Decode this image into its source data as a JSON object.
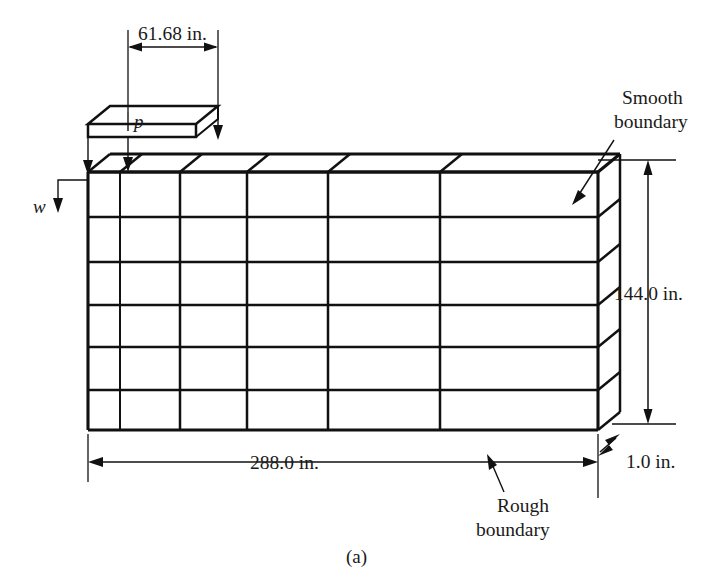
{
  "figure": {
    "caption": "(a)",
    "dimensions": {
      "top_patch_width": "61.68 in.",
      "overall_width": "288.0 in.",
      "overall_height": "144.0 in.",
      "thickness": "1.0 in."
    },
    "labels": {
      "pressure": "p",
      "deflection": "w"
    },
    "annotations": {
      "smooth_boundary_line1": "Smooth",
      "smooth_boundary_line2": "boundary",
      "rough_boundary_line1": "Rough",
      "rough_boundary_line2": "boundary"
    },
    "colors": {
      "ink": "#111111",
      "background": "#ffffff"
    }
  },
  "mesh": {
    "columns": 6,
    "rows": 6,
    "column_x": [
      88,
      120,
      180,
      247,
      328,
      440,
      598
    ],
    "row_y": [
      172,
      217,
      262,
      305,
      347,
      390,
      430
    ],
    "depth_dx": 22,
    "depth_dy": -18
  }
}
